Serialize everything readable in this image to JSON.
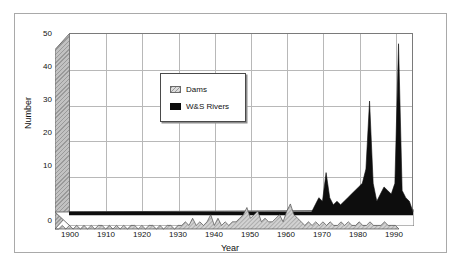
{
  "figure": {
    "frame_color": "#a9a9a9",
    "background": "#ffffff"
  },
  "legend": {
    "position": "inside-upper-left",
    "entries": [
      {
        "label": "Dams",
        "swatch": "hatched-gray-swatch",
        "color": "#c2c2c2"
      },
      {
        "label": "W&S Rivers",
        "swatch": "solid-black-swatch",
        "color": "#0d0d0d"
      }
    ]
  },
  "axes": {
    "ylabel": "Number",
    "xlabel": "Year",
    "yticks": [
      "50",
      "40",
      "30",
      "20",
      "10",
      "0"
    ],
    "xticks": [
      "1900",
      "1910",
      "1920",
      "1930",
      "1940",
      "1950",
      "1960",
      "1970",
      "1980",
      "1990"
    ]
  },
  "chart_data": {
    "type": "area",
    "title": "",
    "subtitle": "",
    "xlabel": "Year",
    "ylabel": "Number",
    "xlim": [
      1900,
      1995
    ],
    "ylim": [
      0,
      50
    ],
    "grid": true,
    "legend_position": "inside-upper-left",
    "style": "3d-stacked-area",
    "annotations": [
      "Dams series stays low (0-7) across the century",
      "W&S Rivers series is near zero until ~1968, then spikes: ~11 in 1971, ~31 in 1983, ~47 in 1991"
    ],
    "x": [
      1900,
      1901,
      1902,
      1903,
      1904,
      1905,
      1906,
      1907,
      1908,
      1909,
      1910,
      1911,
      1912,
      1913,
      1914,
      1915,
      1916,
      1917,
      1918,
      1919,
      1920,
      1921,
      1922,
      1923,
      1924,
      1925,
      1926,
      1927,
      1928,
      1929,
      1930,
      1931,
      1932,
      1933,
      1934,
      1935,
      1936,
      1937,
      1938,
      1939,
      1940,
      1941,
      1942,
      1943,
      1944,
      1945,
      1946,
      1947,
      1948,
      1949,
      1950,
      1951,
      1952,
      1953,
      1954,
      1955,
      1956,
      1957,
      1958,
      1959,
      1960,
      1961,
      1962,
      1963,
      1964,
      1965,
      1966,
      1967,
      1968,
      1969,
      1970,
      1971,
      1972,
      1973,
      1974,
      1975,
      1976,
      1977,
      1978,
      1979,
      1980,
      1981,
      1982,
      1983,
      1984,
      1985,
      1986,
      1987,
      1988,
      1989,
      1990,
      1991,
      1992,
      1993,
      1994,
      1995
    ],
    "series": [
      {
        "name": "Dams",
        "color": "#c2c2c2",
        "values": [
          0,
          0,
          1,
          0,
          1,
          0,
          1,
          0,
          1,
          0,
          1,
          0,
          1,
          1,
          0,
          1,
          0,
          1,
          0,
          1,
          0,
          1,
          1,
          0,
          1,
          0,
          1,
          1,
          0,
          1,
          0,
          1,
          1,
          0,
          1,
          1,
          2,
          1,
          3,
          1,
          2,
          1,
          2,
          4,
          1,
          3,
          1,
          2,
          1,
          2,
          2,
          3,
          4,
          6,
          3,
          4,
          5,
          2,
          3,
          2,
          2,
          3,
          4,
          2,
          5,
          7,
          4,
          3,
          2,
          1,
          2,
          1,
          2,
          1,
          2,
          1,
          2,
          1,
          1,
          2,
          1,
          2,
          1,
          1,
          2,
          1,
          1,
          2,
          1,
          1,
          1,
          2,
          1,
          1,
          1,
          0
        ]
      },
      {
        "name": "W&S Rivers",
        "color": "#0d0d0d",
        "values": [
          0,
          0,
          0,
          0,
          0,
          0,
          0,
          0,
          0,
          0,
          0,
          0,
          0,
          0,
          0,
          0,
          0,
          0,
          0,
          0,
          0,
          0,
          0,
          0,
          0,
          0,
          0,
          0,
          0,
          0,
          0,
          0,
          0,
          0,
          0,
          0,
          0,
          0,
          0,
          0,
          0,
          0,
          0,
          0,
          0,
          0,
          0,
          0,
          0,
          0,
          0,
          0,
          0,
          0,
          0,
          0,
          0,
          0,
          0,
          0,
          0,
          0,
          0,
          0,
          0,
          0,
          0,
          0,
          2,
          4,
          3,
          11,
          4,
          2,
          3,
          2,
          3,
          4,
          5,
          6,
          7,
          8,
          12,
          31,
          8,
          3,
          5,
          7,
          6,
          5,
          8,
          47,
          6,
          4,
          3,
          0
        ]
      }
    ]
  }
}
